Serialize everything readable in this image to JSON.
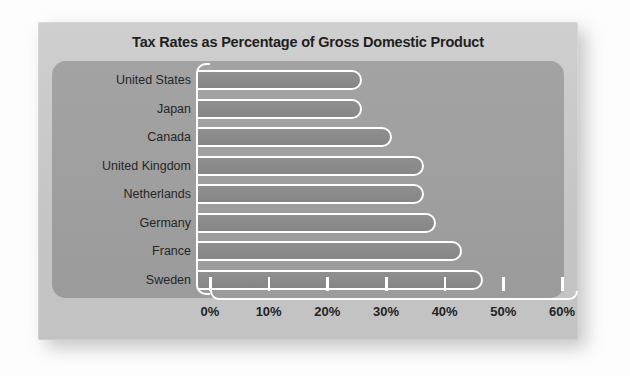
{
  "chart_data": {
    "type": "bar",
    "orientation": "horizontal",
    "title": "Tax Rates as Percentage of Gross Domestic Product",
    "xlabel": "",
    "ylabel": "",
    "categories": [
      "United States",
      "Japan",
      "Canada",
      "United Kingdom",
      "Netherlands",
      "Germany",
      "France",
      "Sweden"
    ],
    "values": [
      28,
      28,
      33,
      38.5,
      38.5,
      40.5,
      45,
      48.5
    ],
    "value_unit": "%",
    "xlim": [
      0,
      60
    ],
    "xtick_values": [
      0,
      10,
      20,
      30,
      40,
      50,
      60
    ],
    "xtick_labels": [
      "0%",
      "10%",
      "20%",
      "30%",
      "40%",
      "50%",
      "60%"
    ],
    "grid": false,
    "legend": false,
    "series": [
      {
        "name": "Tax rate as % of GDP",
        "values": [
          28,
          28,
          33,
          38.5,
          38.5,
          40.5,
          45,
          48.5
        ]
      }
    ]
  },
  "colors": {
    "page_background": "#fdfdfd",
    "card_background": "#c9c9c9",
    "plot_panel": "#9e9e9e",
    "bar_fill": "#8b8b8b",
    "bar_outline": "#ffffff",
    "axis": "#ffffff",
    "title_text": "#1f1f1f",
    "label_text": "#262626"
  }
}
